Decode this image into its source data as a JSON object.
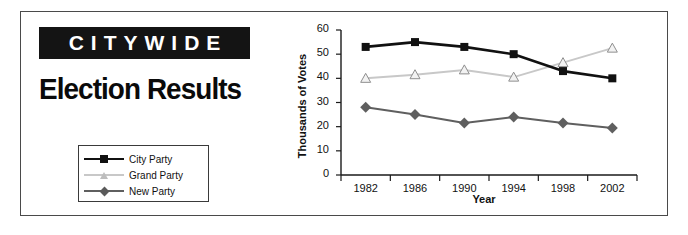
{
  "article": {
    "kicker": "CITYWIDE",
    "headline": "Election Results"
  },
  "legend": {
    "position": "left-panel",
    "items": [
      {
        "label": "City Party",
        "color": "#111111",
        "marker": "square"
      },
      {
        "label": "Grand Party",
        "color": "#c8c8c8",
        "marker": "triangle"
      },
      {
        "label": "New Party",
        "color": "#5f5f5f",
        "marker": "diamond"
      }
    ]
  },
  "chart_data": {
    "type": "line",
    "title": "",
    "xlabel": "Year",
    "ylabel": "Thousands of Votes",
    "categories": [
      "1982",
      "1986",
      "1990",
      "1994",
      "1998",
      "2002"
    ],
    "ylim": [
      0,
      60
    ],
    "yticks": [
      0,
      10,
      20,
      30,
      40,
      50,
      60
    ],
    "grid": false,
    "legend_position": "outside-left",
    "series": [
      {
        "name": "City Party",
        "color": "#111111",
        "marker": "square",
        "values": [
          53,
          55,
          53,
          50,
          43,
          40
        ]
      },
      {
        "name": "Grand Party",
        "color": "#c8c8c8",
        "marker": "triangle",
        "values": [
          40,
          41.5,
          43.5,
          40.5,
          46.5,
          52.5
        ]
      },
      {
        "name": "New Party",
        "color": "#5f5f5f",
        "marker": "diamond",
        "values": [
          28,
          25,
          21.5,
          24,
          21.5,
          19.5
        ]
      }
    ]
  }
}
